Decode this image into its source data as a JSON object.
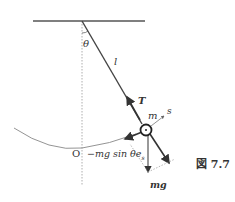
{
  "figure": {
    "caption": "図 7.7",
    "labels": {
      "theta": "θ",
      "length": "l",
      "tension": "T",
      "mass": "m",
      "s_axis": "s",
      "origin": "O",
      "restoring_force": "−mg sin θe",
      "restoring_force_sub": "s",
      "gravity": "mg"
    },
    "colors": {
      "line": "#444444",
      "guide": "#999999",
      "arc": "#777777"
    }
  }
}
